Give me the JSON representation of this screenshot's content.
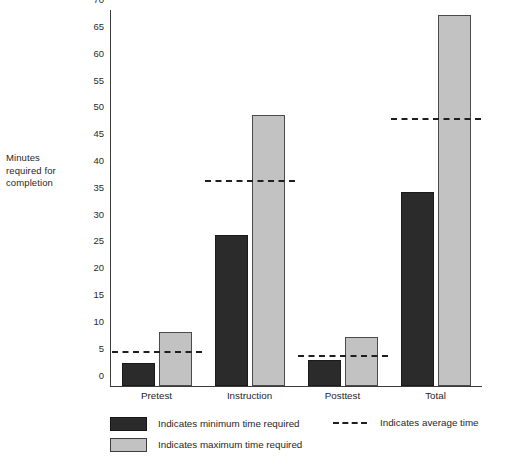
{
  "chart_data": {
    "type": "bar",
    "title": "",
    "xlabel": "",
    "ylabel": "Minutes required for completion",
    "categories": [
      "Pretest",
      "Instruction",
      "Posttest",
      "Total"
    ],
    "series": [
      {
        "name": "Indicates minimum time required",
        "color": "#2b2b2b",
        "values": [
          4.3,
          28,
          4.8,
          36
        ]
      },
      {
        "name": "Indicates maximum time required",
        "color": "#c2c2c2",
        "values": [
          10,
          50.5,
          9,
          69
        ]
      },
      {
        "name": "Indicates average time",
        "color": "#1f1f1f",
        "style": "dashed-line",
        "values": [
          6,
          38,
          5.3,
          49.5
        ]
      }
    ],
    "ylim": [
      0,
      70
    ],
    "ytick_step": 5,
    "yticks": [
      0,
      5,
      10,
      15,
      20,
      25,
      30,
      35,
      40,
      45,
      50,
      55,
      60,
      65,
      70
    ],
    "grid": false,
    "legend_position": "bottom"
  },
  "axis": {
    "y_title_lines": [
      "Minutes",
      "required for",
      "completion"
    ],
    "y_title_text": "Minutes required for completion"
  },
  "legend": {
    "min_label": "Indicates minimum time required",
    "max_label": "Indicates maximum time required",
    "avg_label": "Indicates average time"
  }
}
